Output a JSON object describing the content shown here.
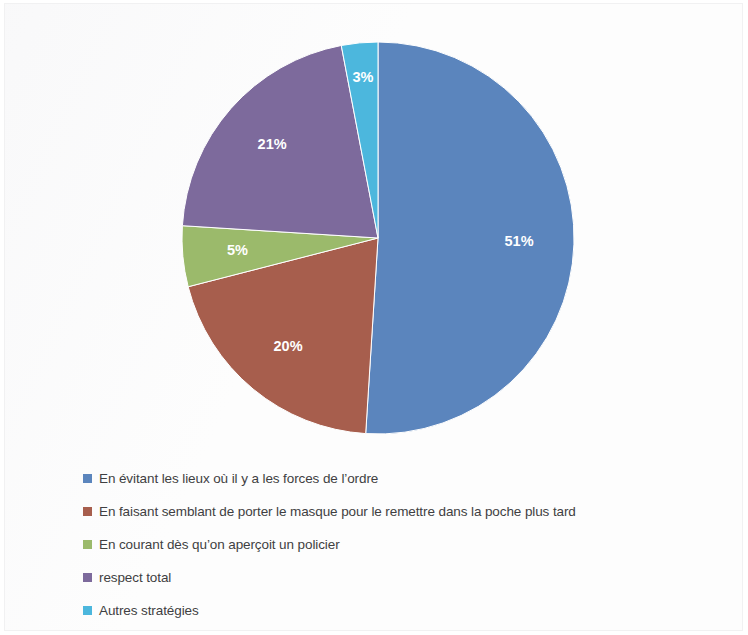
{
  "chart_data": {
    "type": "pie",
    "title": "",
    "subtitle": "",
    "xlabel": "",
    "ylabel": "",
    "grid": false,
    "legend_position": "bottom-left",
    "start_angle_deg": 0,
    "direction": "clockwise",
    "categories": [
      "En évitant les lieux où il y a les forces de l’ordre",
      "En faisant semblant de porter le masque pour le remettre dans la poche plus tard",
      "En courant dès qu’on aperçoit un policier",
      "respect total",
      "Autres stratégies"
    ],
    "values": [
      51,
      20,
      5,
      21,
      3
    ],
    "value_labels": [
      "51%",
      "20%",
      "5%",
      "21%",
      "3%"
    ],
    "colors": [
      "#5b85bd",
      "#a75e4d",
      "#9bba6b",
      "#7d6a9c",
      "#4cb7dd"
    ],
    "units": "percent"
  },
  "pie": {
    "slices": [
      {
        "label": "En évitant les lieux où il y a les forces de l’ordre",
        "value": 51,
        "value_label": "51%",
        "color": "#5b85bd",
        "name": "slice-en-evitant-les-lieux"
      },
      {
        "label": "En faisant semblant de porter le masque pour le remettre dans la poche plus tard",
        "value": 20,
        "value_label": "20%",
        "color": "#a75e4d",
        "name": "slice-en-faisant-semblant"
      },
      {
        "label": "En courant dès qu’on aperçoit un policier",
        "value": 5,
        "value_label": "5%",
        "color": "#9bba6b",
        "name": "slice-en-courant"
      },
      {
        "label": "respect total",
        "value": 21,
        "value_label": "21%",
        "color": "#7d6a9c",
        "name": "slice-respect-total"
      },
      {
        "label": "Autres stratégies",
        "value": 3,
        "value_label": "3%",
        "color": "#4cb7dd",
        "name": "slice-autres-strategies"
      }
    ]
  },
  "legend": {
    "items": [
      {
        "label": "En évitant les lieux où il y a les forces de l’ordre",
        "color": "#5b85bd"
      },
      {
        "label": "En faisant semblant de porter le masque pour le remettre dans la poche plus tard",
        "color": "#a75e4d"
      },
      {
        "label": "En courant dès qu’on aperçoit un policier",
        "color": "#9bba6b"
      },
      {
        "label": "respect total",
        "color": "#7d6a9c"
      },
      {
        "label": "Autres stratégies",
        "color": "#4cb7dd"
      }
    ]
  }
}
